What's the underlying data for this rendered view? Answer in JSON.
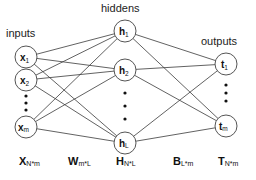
{
  "diagram": {
    "layers": {
      "inputs": {
        "label": "inputs",
        "nodes": [
          {
            "base": "x",
            "sub": "1"
          },
          {
            "base": "x",
            "sub": "2"
          },
          {
            "base": "x",
            "sub": "m"
          }
        ]
      },
      "hiddens": {
        "label": "hiddens",
        "nodes": [
          {
            "base": "h",
            "sub": "1"
          },
          {
            "base": "h",
            "sub": "2"
          },
          {
            "base": "h",
            "sub": "L"
          }
        ]
      },
      "outputs": {
        "label": "outputs",
        "nodes": [
          {
            "base": "t",
            "sub": "1"
          },
          {
            "base": "t",
            "sub": "m"
          }
        ]
      }
    },
    "matrices": [
      {
        "base": "X",
        "sub": "N*m"
      },
      {
        "base": "W",
        "sub": "m*L"
      },
      {
        "base": "H",
        "sub": "N*L"
      },
      {
        "base": "B",
        "sub": "L*m"
      },
      {
        "base": "T",
        "sub": "N*m"
      }
    ],
    "colors": {
      "edge": "#3a3a3a",
      "node_stroke": "#555555",
      "text": "#111111"
    }
  }
}
